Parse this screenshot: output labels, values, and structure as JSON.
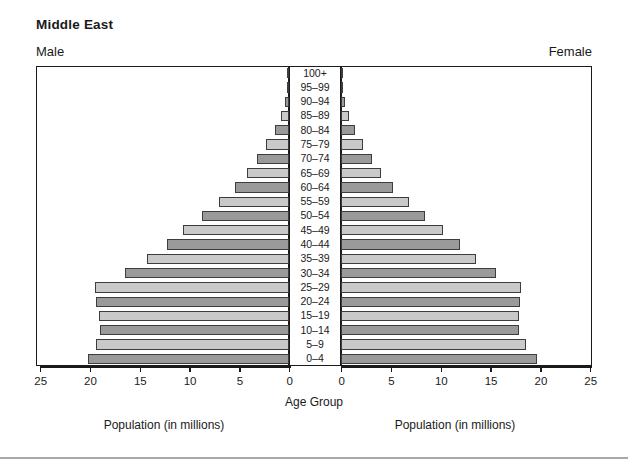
{
  "chart": {
    "title": "Middle East",
    "male_label": "Male",
    "female_label": "Female",
    "center_caption": "Age Group",
    "left_caption": "Population (in millions)",
    "right_caption": "Population (in millions)"
  },
  "colors": {
    "bar_light": "#c9c9c9",
    "bar_dark": "#9a9a9a",
    "bar_border": "#3d3d3d",
    "frame": "#1a1a1a",
    "text": "#1a1a1a",
    "background": "#ffffff",
    "rule": "#a8a8a8"
  },
  "axis": {
    "left_ticks": [
      "25",
      "20",
      "15",
      "10",
      "5",
      "0"
    ],
    "right_ticks": [
      "0",
      "5",
      "10",
      "15",
      "20",
      "25"
    ],
    "tick_values": [
      25,
      20,
      15,
      10,
      5,
      0
    ],
    "max": 25,
    "min": 0,
    "unit": "millions"
  },
  "chart_data": {
    "type": "bar",
    "subtype": "population-pyramid",
    "title": "Middle East",
    "xlabel": "Population (in millions)",
    "ylabel": "Age Group",
    "xlim": [
      0,
      25
    ],
    "grid": false,
    "legend": [
      "Male",
      "Female"
    ],
    "legend_position": "top-left and top-right",
    "orientation": "horizontal-diverging",
    "categories": [
      "100+",
      "95–99",
      "90–94",
      "85–89",
      "80–84",
      "75–79",
      "70–74",
      "65–69",
      "60–64",
      "55–59",
      "50–54",
      "45–49",
      "40–44",
      "35–39",
      "30–34",
      "25–29",
      "20–24",
      "15–19",
      "10–14",
      "5–9",
      "0–4"
    ],
    "series": [
      {
        "name": "Male",
        "side": "left",
        "values": [
          0.1,
          0.2,
          0.4,
          0.8,
          1.4,
          2.3,
          3.2,
          4.2,
          5.4,
          7.0,
          8.7,
          10.6,
          12.3,
          14.3,
          16.5,
          19.5,
          19.4,
          19.1,
          19.0,
          19.4,
          20.2
        ]
      },
      {
        "name": "Female",
        "side": "right",
        "values": [
          0.1,
          0.2,
          0.4,
          0.8,
          1.4,
          2.2,
          3.1,
          4.0,
          5.2,
          6.8,
          8.4,
          10.2,
          11.9,
          13.6,
          15.6,
          18.1,
          18.0,
          17.9,
          17.9,
          18.6,
          19.7
        ]
      }
    ]
  }
}
